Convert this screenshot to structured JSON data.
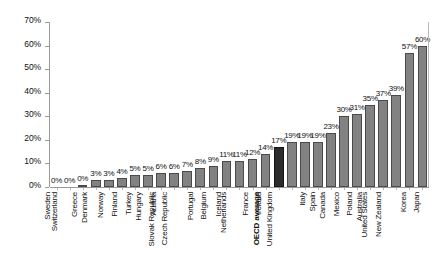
{
  "chart_data": {
    "type": "bar",
    "title": "",
    "subtitle": "",
    "xlabel": "",
    "ylabel": "",
    "ylim": [
      0,
      70
    ],
    "ytick_labels": [
      "70%",
      "60%",
      "50%",
      "40%",
      "30%",
      "20%",
      "10%",
      "0%"
    ],
    "ytick_values": [
      70,
      60,
      50,
      40,
      30,
      20,
      10,
      0
    ],
    "grid": false,
    "legend": "none",
    "highlight_category": "OECD average",
    "colors": {
      "bar": "#828282",
      "bar_border": "#4a4a4a",
      "highlight_bar": "#2b2b2b",
      "highlight_border": "#141414",
      "axis": "#9a9a9a",
      "text": "#111111",
      "background": "#ffffff"
    },
    "categories": [
      "Sweden",
      "Switzerland",
      "Greece",
      "Denmark",
      "Norway",
      "Finland",
      "Turkey",
      "Hungary",
      "Austria",
      "Slovak Republic",
      "Czech Republic",
      "Portugal",
      "Belgium",
      "Iceland",
      "Netherlands",
      "France",
      "Ireland",
      "OECD average",
      "United Kingdom",
      "Italy",
      "Spain",
      "Canada",
      "Mexico",
      "Poland",
      "Australia",
      "United States",
      "New Zealand",
      "Korea",
      "Japan"
    ],
    "values": [
      0,
      0,
      1,
      3,
      3,
      4,
      5,
      5,
      6,
      6,
      7,
      8,
      9,
      11,
      11,
      12,
      14,
      17,
      19,
      19,
      19,
      23,
      30,
      31,
      35,
      37,
      39,
      57,
      60
    ],
    "data_labels": [
      "0%",
      "0%",
      "0%",
      "3%",
      "3%",
      "4%",
      "5%",
      "5%",
      "6%",
      "6%",
      "7%",
      "8%",
      "9%",
      "11%",
      "11%",
      "12%",
      "14%",
      "17%",
      "19%",
      "19%",
      "19%",
      "23%",
      "30%",
      "31%",
      "35%",
      "37%",
      "39%",
      "57%",
      "60%"
    ]
  }
}
